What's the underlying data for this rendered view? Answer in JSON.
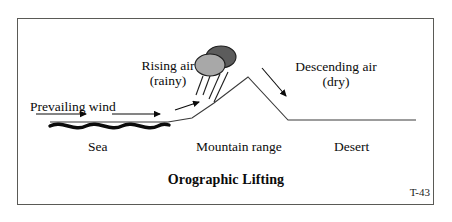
{
  "figure": {
    "title": "Orographic Lifting",
    "plate_code": "T-43",
    "frame_color": "#5a5a56",
    "ink_color": "#0b0b0b"
  },
  "labels": {
    "prevailing_wind": "Prevailing wind",
    "rising_air": "Rising air",
    "rising_air_sub": "(rainy)",
    "descending_air": "Descending air",
    "descending_air_sub": "(dry)",
    "sea": "Sea",
    "mountain_range": "Mountain range",
    "desert": "Desert"
  },
  "graphics": {
    "terrain_path": "M 50 122 L 168 122 L 192 118 L 214 103 L 248 77 L 288 120 L 416 120",
    "sea_wave_path": "M 50 126 C 62 120, 74 132, 86 126 C 98 120, 110 132, 122 126 C 134 120, 146 132, 158 126 C 163 123, 166 124, 169 125",
    "wind_arrow_1": {
      "x1": 36,
      "y1": 114,
      "x2": 86,
      "y2": 114
    },
    "wind_arrow_2": {
      "x1": 112,
      "y1": 114,
      "x2": 160,
      "y2": 114
    },
    "rising_arrow": {
      "x1": 175,
      "y1": 110,
      "x2": 199,
      "y2": 102
    },
    "descending_arrow": {
      "x1": 262,
      "y1": 68,
      "x2": 286,
      "y2": 96
    },
    "cloud_back": {
      "cx": 221,
      "cy": 57,
      "rx": 15,
      "ry": 11,
      "fill": "#5c5c5c"
    },
    "cloud_front": {
      "cx": 210,
      "cy": 65,
      "rx": 15,
      "ry": 11,
      "fill": "#a8a8a8"
    },
    "rain_streaks": [
      {
        "x1": 203,
        "y1": 76,
        "x2": 196,
        "y2": 95
      },
      {
        "x1": 210,
        "y1": 76,
        "x2": 203,
        "y2": 95
      },
      {
        "x1": 220,
        "y1": 74,
        "x2": 209,
        "y2": 99
      },
      {
        "x1": 228,
        "y1": 72,
        "x2": 214,
        "y2": 102
      }
    ]
  }
}
